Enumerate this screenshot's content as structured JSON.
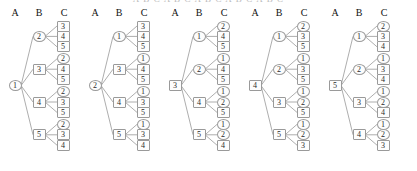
{
  "figure": {
    "top_sliver_text": "A B C A B C A B C A B C A B C",
    "column_headers": [
      "A",
      "B",
      "C"
    ],
    "node_shape_circle": "circle",
    "node_shape_square": "square",
    "edge_color": "#8a8a8a",
    "node_border_color": "#9a9a9a",
    "text_color": "#2a2a2a"
  },
  "chart_data": {
    "type": "diagram",
    "title": "",
    "columns": [
      "A",
      "B",
      "C"
    ],
    "trees": [
      {
        "root": "1",
        "root_shape": "circle",
        "branches": [
          {
            "b": "2",
            "b_shape": "circle",
            "c": [
              "3",
              "4",
              "5"
            ],
            "c_shapes": [
              "square",
              "square",
              "square"
            ]
          },
          {
            "b": "3",
            "b_shape": "square",
            "c": [
              "2",
              "4",
              "5"
            ],
            "c_shapes": [
              "circle",
              "square",
              "square"
            ]
          },
          {
            "b": "4",
            "b_shape": "square",
            "c": [
              "2",
              "3",
              "5"
            ],
            "c_shapes": [
              "circle",
              "square",
              "square"
            ]
          },
          {
            "b": "5",
            "b_shape": "square",
            "c": [
              "2",
              "3",
              "4"
            ],
            "c_shapes": [
              "circle",
              "square",
              "square"
            ]
          }
        ]
      },
      {
        "root": "2",
        "root_shape": "circle",
        "branches": [
          {
            "b": "1",
            "b_shape": "circle",
            "c": [
              "3",
              "4",
              "5"
            ],
            "c_shapes": [
              "square",
              "square",
              "square"
            ]
          },
          {
            "b": "3",
            "b_shape": "square",
            "c": [
              "1",
              "4",
              "5"
            ],
            "c_shapes": [
              "circle",
              "square",
              "square"
            ]
          },
          {
            "b": "4",
            "b_shape": "square",
            "c": [
              "1",
              "3",
              "5"
            ],
            "c_shapes": [
              "circle",
              "square",
              "square"
            ]
          },
          {
            "b": "5",
            "b_shape": "square",
            "c": [
              "1",
              "3",
              "4"
            ],
            "c_shapes": [
              "circle",
              "square",
              "square"
            ]
          }
        ]
      },
      {
        "root": "3",
        "root_shape": "square",
        "branches": [
          {
            "b": "1",
            "b_shape": "circle",
            "c": [
              "2",
              "4",
              "5"
            ],
            "c_shapes": [
              "circle",
              "square",
              "square"
            ]
          },
          {
            "b": "2",
            "b_shape": "circle",
            "c": [
              "1",
              "4",
              "5"
            ],
            "c_shapes": [
              "circle",
              "square",
              "square"
            ]
          },
          {
            "b": "4",
            "b_shape": "square",
            "c": [
              "1",
              "2",
              "5"
            ],
            "c_shapes": [
              "circle",
              "circle",
              "square"
            ]
          },
          {
            "b": "5",
            "b_shape": "square",
            "c": [
              "1",
              "2",
              "4"
            ],
            "c_shapes": [
              "circle",
              "circle",
              "square"
            ]
          }
        ]
      },
      {
        "root": "4",
        "root_shape": "square",
        "branches": [
          {
            "b": "1",
            "b_shape": "circle",
            "c": [
              "2",
              "3",
              "5"
            ],
            "c_shapes": [
              "circle",
              "square",
              "square"
            ]
          },
          {
            "b": "2",
            "b_shape": "circle",
            "c": [
              "1",
              "3",
              "5"
            ],
            "c_shapes": [
              "circle",
              "square",
              "square"
            ]
          },
          {
            "b": "3",
            "b_shape": "square",
            "c": [
              "1",
              "2",
              "5"
            ],
            "c_shapes": [
              "circle",
              "circle",
              "square"
            ]
          },
          {
            "b": "5",
            "b_shape": "square",
            "c": [
              "1",
              "2",
              "3"
            ],
            "c_shapes": [
              "circle",
              "circle",
              "square"
            ]
          }
        ]
      },
      {
        "root": "5",
        "root_shape": "square",
        "branches": [
          {
            "b": "1",
            "b_shape": "circle",
            "c": [
              "2",
              "3",
              "4"
            ],
            "c_shapes": [
              "circle",
              "square",
              "square"
            ]
          },
          {
            "b": "2",
            "b_shape": "circle",
            "c": [
              "1",
              "3",
              "4"
            ],
            "c_shapes": [
              "circle",
              "square",
              "square"
            ]
          },
          {
            "b": "3",
            "b_shape": "square",
            "c": [
              "1",
              "2",
              "4"
            ],
            "c_shapes": [
              "circle",
              "circle",
              "square"
            ]
          },
          {
            "b": "4",
            "b_shape": "square",
            "c": [
              "1",
              "2",
              "3"
            ],
            "c_shapes": [
              "circle",
              "circle",
              "square"
            ]
          }
        ]
      }
    ]
  }
}
